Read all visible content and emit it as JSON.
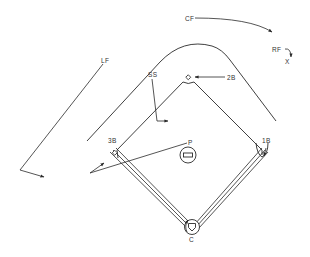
{
  "diagram": {
    "colors": {
      "line": "#2a2a2a",
      "label": "#333333",
      "background": "#ffffff"
    },
    "positions": {
      "lf": "LF",
      "cf": "CF",
      "rf": "RF",
      "x_marker": "X",
      "ss": "SS",
      "second_base": "2B",
      "third_base": "3B",
      "first_base": "1B",
      "pitcher": "P",
      "catcher": "C"
    }
  }
}
